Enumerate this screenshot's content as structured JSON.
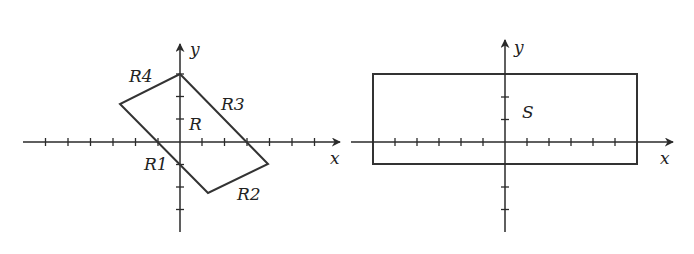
{
  "figures": [
    {
      "id": "left",
      "axes": {
        "x_label": "x",
        "y_label": "y"
      },
      "region_label": "R",
      "shape": "parallelogram",
      "edge_labels": [
        "R1",
        "R2",
        "R3",
        "R4"
      ],
      "tick_spacing": 1
    },
    {
      "id": "right",
      "axes": {
        "x_label": "x",
        "y_label": "y"
      },
      "region_label": "S",
      "shape": "rectangle"
    }
  ],
  "colors": {
    "stroke": "#333333",
    "background": "#ffffff"
  }
}
